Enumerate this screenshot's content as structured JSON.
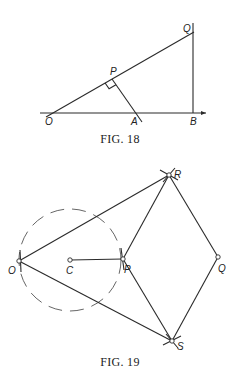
{
  "fig18": {
    "caption": "FIG. 18",
    "labels": {
      "O": "O",
      "A": "A",
      "B": "B",
      "P": "P",
      "Q": "Q"
    }
  },
  "fig19": {
    "caption": "FIG. 19",
    "labels": {
      "O": "O",
      "C": "C",
      "P": "P",
      "Q": "Q",
      "R": "R",
      "S": "S"
    }
  }
}
